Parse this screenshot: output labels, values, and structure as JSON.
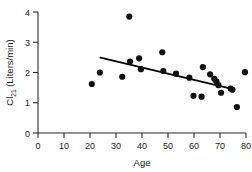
{
  "chart_data": {
    "type": "scatter",
    "title": "",
    "xlabel": "Age",
    "ylabel": "Cl",
    "ylabel_subscript": "21",
    "ylabel_units": "(Liters/min)",
    "ylabel_full": "Cl21 (Liters/min)",
    "xlim": [
      0,
      80
    ],
    "ylim": [
      0,
      4
    ],
    "xticks": [
      0,
      10,
      20,
      30,
      40,
      50,
      60,
      70,
      80
    ],
    "yticks": [
      0,
      1,
      2,
      3,
      4
    ],
    "grid": false,
    "legend": null,
    "marker": "filled-circle",
    "marker_color": "#111111",
    "points": [
      {
        "x": 20.7,
        "y": 1.62
      },
      {
        "x": 23.8,
        "y": 2.0
      },
      {
        "x": 32.4,
        "y": 1.86
      },
      {
        "x": 35.1,
        "y": 3.85
      },
      {
        "x": 35.4,
        "y": 2.36
      },
      {
        "x": 38.9,
        "y": 2.47
      },
      {
        "x": 39.6,
        "y": 2.11
      },
      {
        "x": 47.8,
        "y": 2.67
      },
      {
        "x": 48.2,
        "y": 2.05
      },
      {
        "x": 53.1,
        "y": 1.96
      },
      {
        "x": 58.2,
        "y": 1.83
      },
      {
        "x": 59.8,
        "y": 1.23
      },
      {
        "x": 62.9,
        "y": 1.2
      },
      {
        "x": 63.4,
        "y": 2.18
      },
      {
        "x": 66.2,
        "y": 1.94
      },
      {
        "x": 67.8,
        "y": 1.79
      },
      {
        "x": 68.6,
        "y": 1.71
      },
      {
        "x": 69.4,
        "y": 1.58
      },
      {
        "x": 70.4,
        "y": 1.33
      },
      {
        "x": 74.1,
        "y": 1.47
      },
      {
        "x": 74.8,
        "y": 1.43
      },
      {
        "x": 76.5,
        "y": 0.86
      },
      {
        "x": 79.6,
        "y": 2.01
      }
    ],
    "trend_line": {
      "type": "linear-fit",
      "x_start": 24.0,
      "y_start": 2.49,
      "x_end": 74.6,
      "y_end": 1.46
    }
  }
}
